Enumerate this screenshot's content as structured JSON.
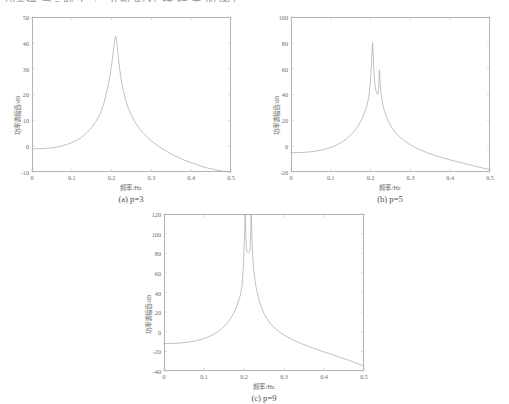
{
  "document": {
    "cutoff_text_fragment": "功率谱 当 p 取 3、5、9 时 的 估 计 结 果 如 图 所 示 。"
  },
  "figures": [
    {
      "id": "figure-a",
      "caption_prefix": "(a) ",
      "caption_symbol": "p",
      "caption_value": "=3",
      "caption_full": "(a) p=3"
    },
    {
      "id": "figure-b",
      "caption_prefix": "(b) ",
      "caption_symbol": "p",
      "caption_value": "=5",
      "caption_full": "(b) p=5"
    },
    {
      "id": "figure-c",
      "caption_prefix": "(c) ",
      "caption_symbol": "p",
      "caption_value": "=9",
      "caption_full": "(c) p=9"
    }
  ],
  "axis_titles": {
    "x": "频率/Hz",
    "y": "功率谱幅值/dB"
  },
  "colors": {
    "curve": "#a8a8a8",
    "frame": "#b4b4b4",
    "text": "#6b6b6b",
    "background": "#ffffff"
  },
  "chart_data": [
    {
      "type": "line",
      "title": "(a) p=3",
      "xlabel": "频率/Hz",
      "ylabel": "功率谱幅值/dB",
      "xlim": [
        0,
        0.5
      ],
      "ylim": [
        -10,
        50
      ],
      "xticks": [
        "0",
        "0.1",
        "0.2",
        "0.3",
        "0.4",
        "0.5"
      ],
      "yticks": [
        "-10",
        "0",
        "10",
        "20",
        "30",
        "40",
        "50"
      ],
      "grid": false,
      "legend": null,
      "peaks": [
        {
          "x": 0.21,
          "y": 42.5
        }
      ],
      "x": [
        0,
        0.01,
        0.02,
        0.03,
        0.04,
        0.05,
        0.06,
        0.07,
        0.08,
        0.09,
        0.1,
        0.11,
        0.12,
        0.13,
        0.14,
        0.15,
        0.16,
        0.17,
        0.18,
        0.19,
        0.195,
        0.2,
        0.203,
        0.206,
        0.208,
        0.21,
        0.212,
        0.214,
        0.217,
        0.22,
        0.225,
        0.23,
        0.24,
        0.25,
        0.26,
        0.27,
        0.28,
        0.29,
        0.3,
        0.32,
        0.34,
        0.36,
        0.38,
        0.4,
        0.42,
        0.44,
        0.46,
        0.48,
        0.5
      ],
      "y": [
        -1.0,
        -1.0,
        -1.0,
        -0.9,
        -0.8,
        -0.6,
        -0.4,
        -0.1,
        0.3,
        0.8,
        1.4,
        2.1,
        3.0,
        4.1,
        5.5,
        7.2,
        9.4,
        12.2,
        16.2,
        22.5,
        26.5,
        31.5,
        35.0,
        39.0,
        41.2,
        42.5,
        41.5,
        39.0,
        34.5,
        30.0,
        25.0,
        21.0,
        15.5,
        11.8,
        9.0,
        6.8,
        5.0,
        3.4,
        2.0,
        -0.3,
        -2.2,
        -3.8,
        -5.2,
        -6.4,
        -7.5,
        -8.4,
        -9.1,
        -9.7,
        -10.0
      ]
    },
    {
      "type": "line",
      "title": "(b) p=5",
      "xlabel": "频率/Hz",
      "ylabel": "功率谱幅值/dB",
      "xlim": [
        0,
        0.5
      ],
      "ylim": [
        -20,
        100
      ],
      "xticks": [
        "0",
        "0.1",
        "0.2",
        "0.3",
        "0.4",
        "0.5"
      ],
      "yticks": [
        "-20",
        "0",
        "20",
        "40",
        "60",
        "80",
        "100"
      ],
      "grid": false,
      "legend": null,
      "peaks": [
        {
          "x": 0.205,
          "y": 80.0
        },
        {
          "x": 0.222,
          "y": 59.0
        }
      ],
      "x": [
        0,
        0.01,
        0.02,
        0.03,
        0.04,
        0.05,
        0.06,
        0.07,
        0.08,
        0.09,
        0.1,
        0.11,
        0.12,
        0.13,
        0.14,
        0.15,
        0.16,
        0.17,
        0.18,
        0.19,
        0.195,
        0.199,
        0.202,
        0.204,
        0.205,
        0.2065,
        0.208,
        0.21,
        0.212,
        0.2135,
        0.215,
        0.2165,
        0.218,
        0.2195,
        0.221,
        0.222,
        0.2235,
        0.225,
        0.227,
        0.23,
        0.235,
        0.24,
        0.25,
        0.26,
        0.27,
        0.28,
        0.29,
        0.3,
        0.32,
        0.34,
        0.36,
        0.38,
        0.4,
        0.42,
        0.44,
        0.46,
        0.48,
        0.5
      ],
      "y": [
        -5.0,
        -5.0,
        -4.9,
        -4.8,
        -4.6,
        -4.3,
        -3.9,
        -3.4,
        -2.8,
        -2.0,
        -1.0,
        0.2,
        1.7,
        3.5,
        5.8,
        8.6,
        12.0,
        16.3,
        22.0,
        30.5,
        37.0,
        48.0,
        62.0,
        74.0,
        80.0,
        71.0,
        60.0,
        50.0,
        45.0,
        43.0,
        41.5,
        40.5,
        40.0,
        42.0,
        50.0,
        59.0,
        52.0,
        45.0,
        39.0,
        33.0,
        27.0,
        22.5,
        16.0,
        11.5,
        8.0,
        5.3,
        3.0,
        1.0,
        -2.2,
        -4.8,
        -7.0,
        -8.9,
        -10.6,
        -12.2,
        -13.8,
        -15.3,
        -16.8,
        -18.2
      ]
    },
    {
      "type": "line",
      "title": "(c) p=9",
      "xlabel": "频率/Hz",
      "ylabel": "功率谱幅值/dB",
      "xlim": [
        0,
        0.5
      ],
      "ylim": [
        -40,
        120
      ],
      "xticks": [
        "0",
        "0.1",
        "0.2",
        "0.3",
        "0.4",
        "0.5"
      ],
      "yticks": [
        "-40",
        "-20",
        "0",
        "20",
        "40",
        "60",
        "80",
        "100",
        "120"
      ],
      "grid": false,
      "legend": null,
      "peaks": [
        {
          "x": 0.203,
          "y": 120
        },
        {
          "x": 0.218,
          "y": 120
        }
      ],
      "x": [
        0,
        0.01,
        0.02,
        0.03,
        0.04,
        0.05,
        0.06,
        0.07,
        0.08,
        0.09,
        0.1,
        0.11,
        0.12,
        0.13,
        0.14,
        0.15,
        0.16,
        0.17,
        0.18,
        0.19,
        0.195,
        0.199,
        0.2015,
        0.2025,
        0.203,
        0.2038,
        0.2045,
        0.206,
        0.2075,
        0.209,
        0.2105,
        0.212,
        0.2135,
        0.215,
        0.2165,
        0.2175,
        0.218,
        0.2188,
        0.2197,
        0.2215,
        0.224,
        0.227,
        0.23,
        0.235,
        0.24,
        0.25,
        0.26,
        0.27,
        0.28,
        0.29,
        0.3,
        0.32,
        0.34,
        0.36,
        0.38,
        0.4,
        0.42,
        0.44,
        0.46,
        0.48,
        0.5
      ],
      "y": [
        -12.0,
        -12.0,
        -11.9,
        -11.7,
        -11.5,
        -11.1,
        -10.6,
        -10.0,
        -9.2,
        -8.2,
        -7.0,
        -5.5,
        -3.6,
        -1.3,
        1.6,
        5.2,
        9.8,
        15.6,
        23.5,
        36.0,
        46.0,
        70.0,
        100.0,
        114.0,
        120.0,
        112.0,
        100.0,
        86.0,
        82.0,
        81.0,
        80.5,
        80.5,
        81.0,
        83.0,
        95.0,
        112.0,
        120.0,
        113.0,
        98.0,
        80.0,
        64.0,
        54.0,
        46.0,
        36.0,
        29.0,
        18.5,
        11.5,
        6.5,
        2.6,
        -0.6,
        -3.3,
        -7.8,
        -11.5,
        -14.7,
        -17.7,
        -20.5,
        -23.2,
        -26.0,
        -28.8,
        -31.8,
        -35.0
      ]
    }
  ]
}
